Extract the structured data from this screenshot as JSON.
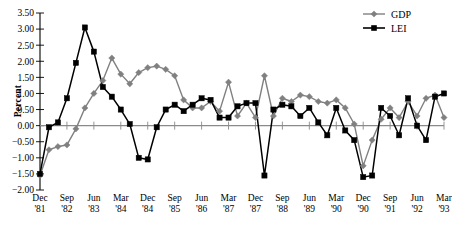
{
  "chart_data": {
    "type": "line",
    "title": "",
    "xlabel": "",
    "ylabel": "Percent",
    "ylim": [
      -2.0,
      3.5
    ],
    "ytick_values": [
      3.5,
      3.0,
      2.5,
      2.0,
      1.5,
      1.0,
      0.5,
      0.0,
      -0.5,
      -1.0,
      -1.5,
      -2.0
    ],
    "ytick_labels": [
      "3.50",
      "3.00",
      "2.50",
      "2.00",
      "1.50",
      "1.00",
      "0.50",
      "0.00",
      "-0.50",
      "-1.00",
      "-1.50",
      "-2.00"
    ],
    "grid": false,
    "legend_position": "top-right",
    "x_tick_labels": [
      {
        "index": 0,
        "month": "Dec",
        "year": "'81"
      },
      {
        "index": 3,
        "month": "Sep",
        "year": "'82"
      },
      {
        "index": 6,
        "month": "Jun",
        "year": "'83"
      },
      {
        "index": 9,
        "month": "Mar",
        "year": "'84"
      },
      {
        "index": 12,
        "month": "Dec",
        "year": "'84"
      },
      {
        "index": 15,
        "month": "Sep",
        "year": "'85"
      },
      {
        "index": 18,
        "month": "Jun",
        "year": "'86"
      },
      {
        "index": 21,
        "month": "Mar",
        "year": "'87"
      },
      {
        "index": 24,
        "month": "Dec",
        "year": "'87"
      },
      {
        "index": 27,
        "month": "Sep",
        "year": "'88"
      },
      {
        "index": 30,
        "month": "Jun",
        "year": "'89"
      },
      {
        "index": 33,
        "month": "Mar",
        "year": "'90"
      },
      {
        "index": 36,
        "month": "Dec",
        "year": "'90"
      },
      {
        "index": 39,
        "month": "Sep",
        "year": "'91"
      },
      {
        "index": 42,
        "month": "Jun",
        "year": "'92"
      },
      {
        "index": 45,
        "month": "Mar",
        "year": "'93"
      }
    ],
    "x": [
      "Dec '81",
      "Mar '82",
      "Jun '82",
      "Sep '82",
      "Dec '82",
      "Mar '83",
      "Jun '83",
      "Sep '83",
      "Dec '83",
      "Mar '84",
      "Jun '84",
      "Sep '84",
      "Dec '84",
      "Mar '85",
      "Jun '85",
      "Sep '85",
      "Dec '85",
      "Mar '86",
      "Jun '86",
      "Sep '86",
      "Dec '86",
      "Mar '87",
      "Jun '87",
      "Sep '87",
      "Dec '87",
      "Mar '88",
      "Jun '88",
      "Sep '88",
      "Dec '88",
      "Mar '89",
      "Jun '89",
      "Sep '89",
      "Dec '89",
      "Mar '90",
      "Jun '90",
      "Sep '90",
      "Dec '90",
      "Mar '91",
      "Jun '91",
      "Sep '91",
      "Dec '91",
      "Mar '92",
      "Jun '92",
      "Sep '92",
      "Dec '92",
      "Mar '93"
    ],
    "series": [
      {
        "name": "GDP",
        "color": "#808080",
        "marker": "diamond",
        "values": [
          -1.55,
          -0.75,
          -0.65,
          -0.6,
          -0.1,
          0.55,
          1.0,
          1.4,
          2.1,
          1.6,
          1.3,
          1.65,
          1.8,
          1.85,
          1.75,
          1.55,
          0.8,
          0.55,
          0.55,
          0.75,
          0.45,
          1.35,
          0.3,
          0.7,
          0.25,
          1.55,
          0.3,
          0.85,
          0.75,
          0.95,
          0.9,
          0.75,
          0.7,
          0.8,
          0.55,
          0.05,
          -1.25,
          -0.45,
          0.2,
          0.55,
          0.25,
          0.75,
          0.3,
          0.85,
          0.95,
          0.25
        ]
      },
      {
        "name": "LEI",
        "color": "#000000",
        "marker": "square",
        "values": [
          -1.5,
          -0.05,
          0.1,
          0.85,
          1.95,
          3.05,
          2.3,
          1.2,
          0.9,
          0.5,
          0.05,
          -1.0,
          -1.05,
          -0.05,
          0.5,
          0.65,
          0.45,
          0.65,
          0.85,
          0.8,
          0.25,
          0.25,
          0.6,
          0.7,
          0.7,
          -1.55,
          0.5,
          0.65,
          0.6,
          0.3,
          0.55,
          0.1,
          -0.3,
          0.55,
          -0.15,
          -0.45,
          -1.6,
          -1.55,
          0.55,
          0.3,
          -0.3,
          0.85,
          0.0,
          -0.45,
          0.9,
          1.0
        ]
      }
    ]
  },
  "legend": {
    "items": [
      {
        "label": "GDP",
        "color": "#808080",
        "marker": "diamond"
      },
      {
        "label": "LEI",
        "color": "#000000",
        "marker": "square"
      }
    ]
  }
}
